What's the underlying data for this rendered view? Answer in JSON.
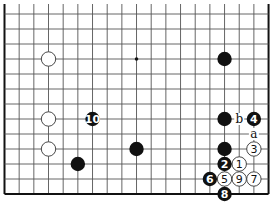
{
  "diagram": {
    "type": "go-board-fragment",
    "board_size": 19,
    "visible_columns": [
      0,
      18
    ],
    "visible_rows": [
      6,
      18
    ],
    "edges": [
      "left",
      "right",
      "bottom"
    ],
    "star_points": [
      {
        "col": 9,
        "row": 9
      }
    ],
    "stones": [
      {
        "color": "white",
        "col": 3,
        "row": 9,
        "label": ""
      },
      {
        "color": "white",
        "col": 3,
        "row": 13,
        "label": ""
      },
      {
        "color": "white",
        "col": 3,
        "row": 15,
        "label": ""
      },
      {
        "color": "black",
        "col": 15,
        "row": 9,
        "label": ""
      },
      {
        "color": "black",
        "col": 15,
        "row": 13,
        "label": ""
      },
      {
        "color": "black",
        "col": 15,
        "row": 15,
        "label": ""
      },
      {
        "color": "black",
        "col": 9,
        "row": 15,
        "label": ""
      },
      {
        "color": "black",
        "col": 5,
        "row": 16,
        "label": ""
      },
      {
        "color": "white",
        "col": 16,
        "row": 16,
        "label": "1"
      },
      {
        "color": "black",
        "col": 15,
        "row": 16,
        "label": "2"
      },
      {
        "color": "white",
        "col": 17,
        "row": 15,
        "label": "3"
      },
      {
        "color": "black",
        "col": 17,
        "row": 13,
        "label": "4"
      },
      {
        "color": "white",
        "col": 15,
        "row": 17,
        "label": "5"
      },
      {
        "color": "black",
        "col": 14,
        "row": 17,
        "label": "6"
      },
      {
        "color": "white",
        "col": 17,
        "row": 17,
        "label": "7"
      },
      {
        "color": "black",
        "col": 15,
        "row": 18,
        "label": "8"
      },
      {
        "color": "white",
        "col": 16,
        "row": 17,
        "label": "9"
      },
      {
        "color": "black",
        "col": 6,
        "row": 13,
        "label": "10"
      }
    ],
    "labels": [
      {
        "text": "a",
        "col": 17,
        "row": 14
      },
      {
        "text": "b",
        "col": 16,
        "row": 13
      }
    ]
  }
}
